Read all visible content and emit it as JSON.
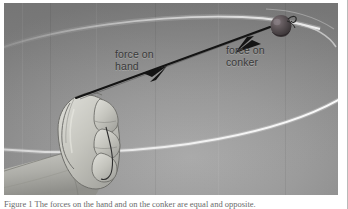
{
  "figure": {
    "labels": {
      "force_on_hand": "force on\nhand",
      "force_on_conker": "force on\nconker"
    },
    "icons": {
      "conker": "conker-icon",
      "hand": "hand-icon",
      "string": "string-icon",
      "orbit": "orbit-path-icon",
      "arrow": "double-headed-force-arrow-icon"
    },
    "colors": {
      "background_dark": "#7e7e7e",
      "background_light": "#a8a8a8",
      "orbit_line": "#f2f2f2",
      "arrow": "#181818",
      "label_text": "#3a3a3a",
      "conker_body": "#4a4446",
      "hand_fill": "#c9c9c4",
      "hand_outline": "#6e6e6c",
      "plate_border": "#ffffff",
      "page_edge": "#b9b9b9"
    },
    "geometry": {
      "arrow_start": [
        71,
        95
      ],
      "arrow_end": [
        268,
        24
      ],
      "conker_center": [
        277,
        23
      ],
      "conker_radius": [
        10,
        11
      ],
      "orbit_upper_arc": "top ellipse arc sweeping from left edge up to the conker",
      "orbit_lower_arc": "bottom ellipse arc sweeping across beneath the hand"
    }
  },
  "caption": {
    "text": "Figure 1 The forces on the hand and on the conker are equal and opposite."
  }
}
